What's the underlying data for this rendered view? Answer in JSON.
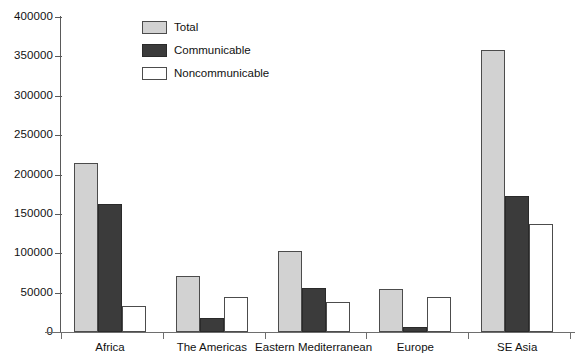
{
  "chart_data": {
    "type": "bar",
    "title": "",
    "subtitle": "",
    "xlabel": "",
    "ylabel": "",
    "categories": [
      "Africa",
      "The Americas",
      "Eastern Mediterranean",
      "Europe",
      "SE Asia"
    ],
    "series": [
      {
        "name": "Total",
        "color": "#d2d2d2",
        "values": [
          215000,
          71000,
          103000,
          54000,
          358000
        ]
      },
      {
        "name": "Communicable",
        "color": "#3b3b3b",
        "values": [
          163000,
          18000,
          56000,
          7000,
          173000
        ]
      },
      {
        "name": "Noncommunicable",
        "color": "#ffffff",
        "values": [
          33000,
          44000,
          38000,
          44000,
          137000
        ]
      }
    ],
    "ylim": [
      0,
      400000
    ],
    "ytick_step": 50000,
    "yticks": [
      0,
      50000,
      100000,
      150000,
      200000,
      250000,
      300000,
      350000,
      400000
    ],
    "ytick_labels": [
      "0",
      "50000",
      "100000",
      "150000",
      "200000",
      "250000",
      "300000",
      "350000",
      "400000"
    ],
    "grid": false,
    "legend_position": "top-left-inside",
    "legend": [
      {
        "label": "Total",
        "swatch": "total"
      },
      {
        "label": "Communicable",
        "swatch": "communicable"
      },
      {
        "label": "Noncommunicable",
        "swatch": "noncommunicable"
      }
    ]
  }
}
